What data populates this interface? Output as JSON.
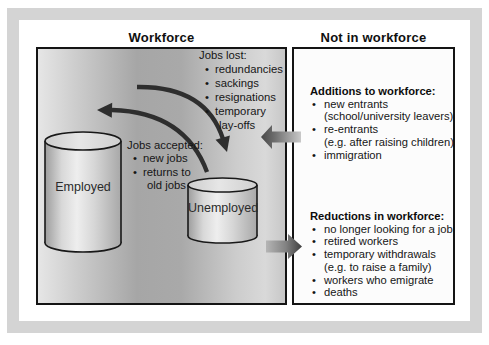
{
  "figure": {
    "workforce_panel": {
      "title": "Workforce",
      "jobs_lost": {
        "heading": "Jobs lost:",
        "lines": [
          {
            "bullet": "•",
            "text": "redundancies"
          },
          {
            "bullet": "•",
            "text": "sackings"
          },
          {
            "bullet": "•",
            "text": "resignations"
          },
          {
            "bullet": "•",
            "text": "temporary"
          },
          {
            "bullet": "",
            "text": "lay-offs"
          }
        ]
      },
      "jobs_accepted": {
        "heading": "Jobs accepted:",
        "lines": [
          {
            "bullet": "•",
            "text": "new jobs"
          },
          {
            "bullet": "•",
            "text": "returns to"
          },
          {
            "bullet": "",
            "text": "old jobs"
          }
        ]
      },
      "cylinders": {
        "employed_label": "Employed",
        "unemployed_label": "Unemployed"
      }
    },
    "not_in_workforce_panel": {
      "title": "Not in workforce",
      "additions": {
        "heading": "Additions to workforce:",
        "lines": [
          {
            "bullet": "•",
            "text": "new entrants"
          },
          {
            "bullet": "",
            "text": "(school/university leavers)"
          },
          {
            "bullet": "•",
            "text": "re-entrants"
          },
          {
            "bullet": "",
            "text": "(e.g. after raising children)"
          },
          {
            "bullet": "•",
            "text": "immigration"
          }
        ]
      },
      "reductions": {
        "heading": "Reductions in workforce:",
        "lines": [
          {
            "bullet": "•",
            "text": "no longer looking for a job"
          },
          {
            "bullet": "•",
            "text": "retired workers"
          },
          {
            "bullet": "•",
            "text": "temporary withdrawals"
          },
          {
            "bullet": "",
            "text": "(e.g. to raise a family)"
          },
          {
            "bullet": "•",
            "text": "workers who emigrate"
          },
          {
            "bullet": "•",
            "text": "deaths"
          }
        ]
      }
    },
    "colors": {
      "frame": "#d4d4d4",
      "box_border": "#141414",
      "flow_arrow": "#2e2e2e",
      "panel_gradient_mid": "#a6a6a6"
    }
  }
}
